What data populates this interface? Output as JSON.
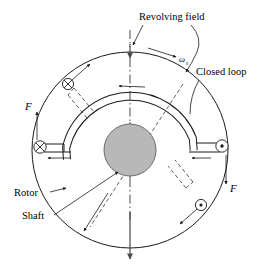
{
  "figure": {
    "background_color": "#ffffff",
    "line_color": "#1a1a1a",
    "hub_fill_color": "#b8b8b8",
    "axis_color": "#4a4a4a"
  },
  "labels": {
    "revolving_field": "Revolving field",
    "closed_loop": "Closed loop",
    "rotor": "Rotor",
    "shaft": "Shaft",
    "force_left": "F",
    "force_right": "F",
    "omega": "ω",
    "omega_subscript": "s"
  },
  "markers": {
    "current_into_page_symbol": "⊗",
    "current_out_of_page_symbol": "⊙",
    "into_page_count": 2,
    "out_of_page_count": 2
  },
  "geometry": {
    "rotor_center_x": 130,
    "rotor_center_y": 150,
    "rotor_radius": 98,
    "hub_radius": 26,
    "loop_outer_radius": 72,
    "loop_inner_radius": 66
  }
}
